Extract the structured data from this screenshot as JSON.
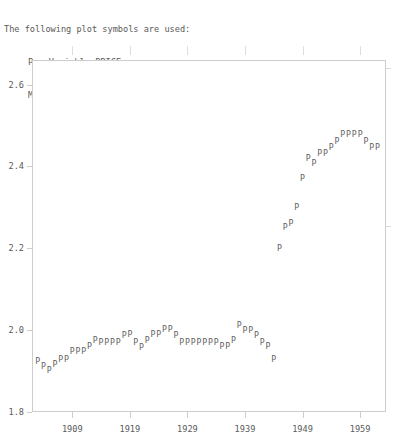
{
  "header": {
    "clipped_top_line": "",
    "line1": "The following plot symbols are used:",
    "line2": "P - Variable PRICE",
    "line3": "M - Missing Data (placed on the horizontal axis)"
  },
  "chart_data": {
    "type": "scatter",
    "title": "",
    "subtitle": "",
    "xlabel": "",
    "ylabel": "",
    "marker_symbol": "P",
    "grid": false,
    "legend_position": "above-plot",
    "legend_entries": [
      "P - Variable PRICE",
      "M - Missing Data (placed on the horizontal axis)"
    ],
    "xlim": [
      1902,
      1963.5
    ],
    "ylim": [
      1.8,
      2.66
    ],
    "xticks": [
      1909,
      1919,
      1929,
      1939,
      1949,
      1959
    ],
    "xtick_labels": [
      "1909",
      "1919",
      "1929",
      "1939",
      "1949",
      "1959"
    ],
    "yticks": [
      1.8,
      2.0,
      2.2,
      2.4,
      2.6
    ],
    "ytick_labels": [
      "1.8",
      "2.0",
      "2.2",
      "2.4",
      "2.6"
    ],
    "series_name": "PRICE",
    "x": [
      1903,
      1904,
      1905,
      1906,
      1907,
      1908,
      1909,
      1910,
      1911,
      1912,
      1913,
      1914,
      1915,
      1916,
      1917,
      1918,
      1919,
      1920,
      1921,
      1922,
      1923,
      1924,
      1925,
      1926,
      1927,
      1928,
      1929,
      1930,
      1931,
      1932,
      1933,
      1934,
      1935,
      1936,
      1937,
      1938,
      1939,
      1940,
      1941,
      1942,
      1943,
      1944,
      1945,
      1946,
      1947,
      1948,
      1949,
      1950,
      1951,
      1952,
      1953,
      1954,
      1955,
      1956,
      1957,
      1958,
      1959,
      1960,
      1961,
      1962
    ],
    "y": [
      1.925,
      1.912,
      1.902,
      1.918,
      1.93,
      1.93,
      1.948,
      1.948,
      1.948,
      1.962,
      1.975,
      1.972,
      1.972,
      1.972,
      1.972,
      1.988,
      1.99,
      1.972,
      1.96,
      1.975,
      1.99,
      1.99,
      2.002,
      2.002,
      1.988,
      1.972,
      1.972,
      1.972,
      1.972,
      1.972,
      1.972,
      1.972,
      1.962,
      1.962,
      1.975,
      2.012,
      2.0,
      2.0,
      1.988,
      1.972,
      1.962,
      1.93,
      2.2,
      2.252,
      2.262,
      2.3,
      2.372,
      2.42,
      2.408,
      2.432,
      2.432,
      2.448,
      2.462,
      2.478,
      2.478,
      2.478,
      2.478,
      2.462,
      2.448,
      2.448
    ],
    "points": [
      {
        "x": 1903,
        "y": 1.925
      },
      {
        "x": 1904,
        "y": 1.912
      },
      {
        "x": 1905,
        "y": 1.902
      },
      {
        "x": 1906,
        "y": 1.918
      },
      {
        "x": 1907,
        "y": 1.93
      },
      {
        "x": 1908,
        "y": 1.93
      },
      {
        "x": 1909,
        "y": 1.948
      },
      {
        "x": 1910,
        "y": 1.948
      },
      {
        "x": 1911,
        "y": 1.948
      },
      {
        "x": 1912,
        "y": 1.962
      },
      {
        "x": 1913,
        "y": 1.975
      },
      {
        "x": 1914,
        "y": 1.972
      },
      {
        "x": 1915,
        "y": 1.972
      },
      {
        "x": 1916,
        "y": 1.972
      },
      {
        "x": 1917,
        "y": 1.972
      },
      {
        "x": 1918,
        "y": 1.988
      },
      {
        "x": 1919,
        "y": 1.99
      },
      {
        "x": 1920,
        "y": 1.972
      },
      {
        "x": 1921,
        "y": 1.96
      },
      {
        "x": 1922,
        "y": 1.975
      },
      {
        "x": 1923,
        "y": 1.99
      },
      {
        "x": 1924,
        "y": 1.99
      },
      {
        "x": 1925,
        "y": 2.002
      },
      {
        "x": 1926,
        "y": 2.002
      },
      {
        "x": 1927,
        "y": 1.988
      },
      {
        "x": 1928,
        "y": 1.972
      },
      {
        "x": 1929,
        "y": 1.972
      },
      {
        "x": 1930,
        "y": 1.972
      },
      {
        "x": 1931,
        "y": 1.972
      },
      {
        "x": 1932,
        "y": 1.972
      },
      {
        "x": 1933,
        "y": 1.972
      },
      {
        "x": 1934,
        "y": 1.972
      },
      {
        "x": 1935,
        "y": 1.962
      },
      {
        "x": 1936,
        "y": 1.962
      },
      {
        "x": 1937,
        "y": 1.975
      },
      {
        "x": 1938,
        "y": 2.012
      },
      {
        "x": 1939,
        "y": 2.0
      },
      {
        "x": 1940,
        "y": 2.0
      },
      {
        "x": 1941,
        "y": 1.988
      },
      {
        "x": 1942,
        "y": 1.972
      },
      {
        "x": 1943,
        "y": 1.962
      },
      {
        "x": 1944,
        "y": 1.93
      },
      {
        "x": 1945,
        "y": 2.2
      },
      {
        "x": 1946,
        "y": 2.252
      },
      {
        "x": 1947,
        "y": 2.262
      },
      {
        "x": 1948,
        "y": 2.3
      },
      {
        "x": 1949,
        "y": 2.372
      },
      {
        "x": 1950,
        "y": 2.42
      },
      {
        "x": 1951,
        "y": 2.408
      },
      {
        "x": 1952,
        "y": 2.432
      },
      {
        "x": 1953,
        "y": 2.432
      },
      {
        "x": 1954,
        "y": 2.448
      },
      {
        "x": 1955,
        "y": 2.462
      },
      {
        "x": 1956,
        "y": 2.478
      },
      {
        "x": 1957,
        "y": 2.478
      },
      {
        "x": 1958,
        "y": 2.478
      },
      {
        "x": 1959,
        "y": 2.478
      },
      {
        "x": 1960,
        "y": 2.462
      },
      {
        "x": 1961,
        "y": 2.448
      },
      {
        "x": 1962,
        "y": 2.448
      }
    ]
  },
  "axes": {
    "frame_color": "#cdcdcd",
    "text_color": "#5a5a5a",
    "marker_color": "#5f5f5f"
  }
}
